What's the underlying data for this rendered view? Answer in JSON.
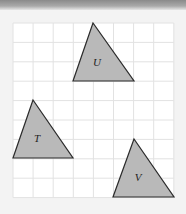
{
  "diagram": {
    "type": "grid-with-triangles",
    "grid": {
      "columns": 8,
      "rows": 9,
      "origin_px": [
        13,
        23
      ],
      "cell_px": [
        20.1,
        19.4
      ],
      "line_color": "#e2e2e2",
      "background": "#ffffff"
    },
    "shape_fill": "#b9b9b9",
    "shape_stroke": "#2b2b2b",
    "triangles": [
      {
        "label": "U",
        "points": [
          [
            93,
            23
          ],
          [
            73,
            81
          ],
          [
            134,
            81
          ]
        ],
        "label_pos": [
          97,
          66
        ]
      },
      {
        "label": "T",
        "points": [
          [
            33,
            100
          ],
          [
            13,
            158
          ],
          [
            73,
            158
          ]
        ],
        "label_pos": [
          37,
          142
        ]
      },
      {
        "label": "V",
        "points": [
          [
            134,
            139
          ],
          [
            113,
            197
          ],
          [
            174,
            197
          ]
        ],
        "label_pos": [
          138,
          181
        ]
      }
    ]
  }
}
